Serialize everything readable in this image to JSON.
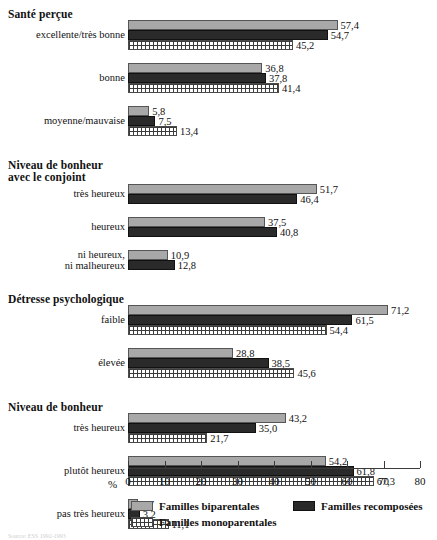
{
  "chart_data": {
    "type": "bar",
    "orientation": "horizontal",
    "title": "",
    "xlabel": "%",
    "ylabel": "",
    "xlim": [
      0,
      80
    ],
    "xticks": [
      0,
      10,
      20,
      30,
      40,
      50,
      60,
      70,
      80
    ],
    "xtick_labels": [
      "0",
      "10",
      "20",
      "30",
      "40",
      "50",
      "60",
      "70",
      "80"
    ],
    "grid": false,
    "legend_position": "bottom",
    "series": [
      {
        "name": "Familles biparentales",
        "key": "biparentales",
        "color": "#a8a8a8",
        "pattern": "solid"
      },
      {
        "name": "Familles recomposées",
        "key": "recomposees",
        "color": "#2a2a2a",
        "pattern": "solid"
      },
      {
        "name": "Familles monoparentales",
        "key": "monoparentales",
        "color": "#ffffff",
        "pattern": "grid-hatch"
      }
    ],
    "sections": [
      {
        "title": "Santé perçue",
        "categories": [
          {
            "label": "excellente/très bonne",
            "values": [
              57.4,
              54.7,
              45.2
            ],
            "labels": [
              "57,4",
              "54,7",
              "45,2"
            ]
          },
          {
            "label": "bonne",
            "values": [
              36.8,
              37.8,
              41.4
            ],
            "labels": [
              "36,8",
              "37,8",
              "41,4"
            ]
          },
          {
            "label": "moyenne/mauvaise",
            "values": [
              5.8,
              7.5,
              13.4
            ],
            "labels": [
              "5,8",
              "7,5",
              "13,4"
            ]
          }
        ]
      },
      {
        "title": "Niveau de bonheur\navec le conjoint",
        "categories": [
          {
            "label": "très heureux",
            "values": [
              51.7,
              46.4
            ],
            "labels": [
              "51,7",
              "46,4"
            ]
          },
          {
            "label": "heureux",
            "values": [
              37.5,
              40.8
            ],
            "labels": [
              "37,5",
              "40,8"
            ]
          },
          {
            "label": "ni heureux,\nni malheureux",
            "values": [
              10.9,
              12.8
            ],
            "labels": [
              "10,9",
              "12,8"
            ]
          }
        ]
      },
      {
        "title": "Détresse psychologique",
        "categories": [
          {
            "label": "faible",
            "values": [
              71.2,
              61.5,
              54.4
            ],
            "labels": [
              "71,2",
              "61,5",
              "54,4"
            ]
          },
          {
            "label": "élevée",
            "values": [
              28.8,
              38.5,
              45.6
            ],
            "labels": [
              "28,8",
              "38,5",
              "45,6"
            ]
          }
        ]
      },
      {
        "title": "Niveau de bonheur",
        "categories": [
          {
            "label": "très heureux",
            "values": [
              43.2,
              35.0,
              21.7
            ],
            "labels": [
              "43,2",
              "35,0",
              "21,7"
            ]
          },
          {
            "label": "plutôt heureux",
            "values": [
              54.2,
              61.8,
              67.3
            ],
            "labels": [
              "54,2",
              "61,8",
              "67,3"
            ]
          },
          {
            "label": "pas très heureux",
            "values": [
              2.7,
              3.2,
              11.1
            ],
            "labels": [
              "2,7",
              "3,2",
              "11,1"
            ]
          }
        ]
      }
    ]
  },
  "axis": {
    "percent_symbol": "%"
  },
  "legend": {
    "items": [
      {
        "label": "Familles biparentales",
        "series": 0
      },
      {
        "label": "Familles recomposées",
        "series": 1
      },
      {
        "label": "Familles monoparentales",
        "series": 2
      }
    ]
  },
  "footer": {
    "source": "Source: ESS 1992-1993"
  }
}
